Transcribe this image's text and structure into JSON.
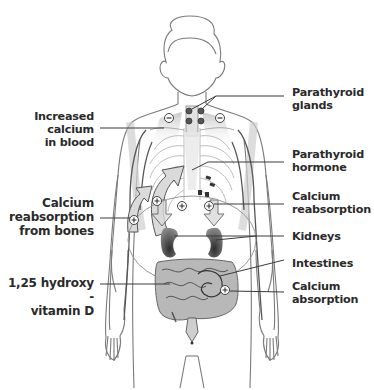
{
  "diagram": {
    "labels": {
      "parathyroid_glands": [
        "Parathyroid",
        "glands"
      ],
      "increased_calcium": [
        "Increased",
        "calcium",
        "in blood"
      ],
      "parathyroid_hormone": [
        "Parathyroid",
        "hormone"
      ],
      "calcium_reabsorption_right": [
        "Calcium",
        "reabsorption"
      ],
      "calcium_reabsorption_bones": [
        "Calcium",
        "reabsorption",
        "from bones"
      ],
      "kidneys": [
        "Kidneys"
      ],
      "vitamin_d": [
        "1,25 hydroxy -",
        "vitamin D"
      ],
      "intestines": [
        "Intestines"
      ],
      "calcium_absorption": [
        "Calcium",
        "absorption"
      ]
    },
    "symbols": {
      "minus": "−",
      "plus": "+"
    },
    "colors": {
      "outline": "#6e6e6e",
      "label_text": "#2a2a2a",
      "leader_line": "#3a3a3a",
      "organ_dark": "#3c3c3c",
      "organ_mid": "#9a9a9a",
      "arrow_fill": "#d9d9d9",
      "background": "#ffffff"
    }
  }
}
